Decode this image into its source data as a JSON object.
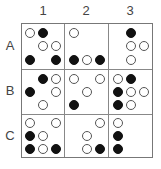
{
  "columns": [
    "1",
    "2",
    "3"
  ],
  "rows": [
    "A",
    "B",
    "C"
  ],
  "legend": {
    "w": "hollow circle",
    "b": "filled circle"
  },
  "colors": {
    "filled": "#111111",
    "hollow_stroke": "#555555",
    "grid": "#888888"
  },
  "cells": {
    "A1": [
      [
        "w",
        "b",
        ""
      ],
      [
        "",
        "w",
        "w"
      ],
      [
        "b",
        "",
        "b"
      ]
    ],
    "A2": [
      [
        "w",
        "",
        ""
      ],
      [
        "",
        "",
        ""
      ],
      [
        "b",
        "w",
        "b"
      ]
    ],
    "A3": [
      [
        "",
        "b",
        ""
      ],
      [
        "",
        "w",
        "w"
      ],
      [
        "",
        "w",
        ""
      ]
    ],
    "B1": [
      [
        "",
        "b",
        "w"
      ],
      [
        "b",
        "",
        "w"
      ],
      [
        "",
        "w",
        ""
      ]
    ],
    "B2": [
      [
        "w",
        "",
        "w"
      ],
      [
        "",
        "w",
        ""
      ],
      [
        "b",
        "",
        ""
      ]
    ],
    "B3": [
      [
        "w",
        "b",
        ""
      ],
      [
        "b",
        "w",
        "w"
      ],
      [
        "b",
        "w",
        ""
      ]
    ],
    "C1": [
      [
        "w",
        "",
        "w"
      ],
      [
        "b",
        "w",
        ""
      ],
      [
        "b",
        "w",
        "b"
      ]
    ],
    "C2": [
      [
        "",
        "",
        "w"
      ],
      [
        "",
        "w",
        ""
      ],
      [
        "",
        "w",
        "b"
      ]
    ],
    "C3": [
      [
        "w",
        "",
        ""
      ],
      [
        "b",
        "",
        ""
      ],
      [
        "b",
        "",
        ""
      ]
    ]
  }
}
